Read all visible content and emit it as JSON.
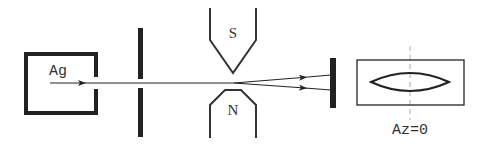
{
  "diagram": {
    "colors": {
      "stroke": "#222222",
      "text": "#333333",
      "dashed": "#aaaaaa",
      "background": "#ffffff"
    },
    "oven": {
      "label": "Ag"
    },
    "magnet": {
      "north_label": "N",
      "south_label": "S"
    },
    "screen": {
      "axis_label": "Az=0"
    }
  }
}
